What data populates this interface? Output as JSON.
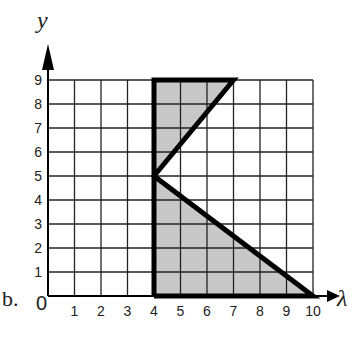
{
  "part_label": "b.",
  "axes": {
    "x_label": "λ",
    "y_label": "y",
    "origin_label": "0",
    "x_ticks": [
      "1",
      "2",
      "3",
      "4",
      "5",
      "6",
      "7",
      "8",
      "9",
      "10"
    ],
    "y_ticks": [
      "1",
      "2",
      "3",
      "4",
      "5",
      "6",
      "7",
      "8",
      "9"
    ]
  },
  "shape": {
    "vertices": [
      [
        4,
        0
      ],
      [
        4,
        9
      ],
      [
        7,
        9
      ],
      [
        4,
        5
      ],
      [
        10,
        0
      ]
    ],
    "fill": "#c8c8c8",
    "stroke": "#000000"
  },
  "chart_data": {
    "type": "diagram",
    "title": "",
    "xlabel": "λ",
    "ylabel": "y",
    "xlim": [
      0,
      10
    ],
    "ylim": [
      0,
      9
    ],
    "grid": true,
    "polygon": [
      [
        4,
        0
      ],
      [
        4,
        9
      ],
      [
        7,
        9
      ],
      [
        4,
        5
      ],
      [
        10,
        0
      ]
    ],
    "shaded_regions": [
      {
        "vertices": [
          [
            4,
            5
          ],
          [
            4,
            9
          ],
          [
            7,
            9
          ]
        ]
      },
      {
        "vertices": [
          [
            4,
            0
          ],
          [
            4,
            5
          ],
          [
            10,
            0
          ]
        ]
      }
    ]
  }
}
